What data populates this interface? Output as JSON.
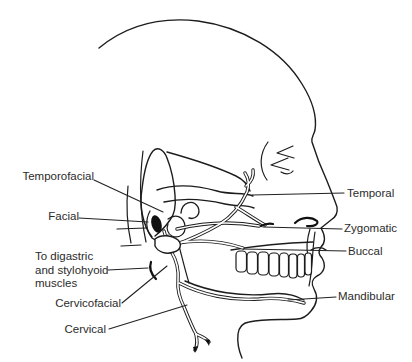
{
  "canvas": {
    "width": 412,
    "height": 362
  },
  "colors": {
    "ink": "#1c1c1c",
    "background": "#ffffff",
    "label_text": "#2b2b2b"
  },
  "figure": {
    "type": "anatomical-line-diagram"
  },
  "labels": {
    "temporofacial": "Temporofacial",
    "facial": "Facial",
    "digastric": "To digastric\nand stylohyoid\nmuscles",
    "cervicofacial": "Cervicofacial",
    "cervical": "Cervical",
    "temporal": "Temporal",
    "zygomatic": "Zygomatic",
    "buccal": "Buccal",
    "mandibular": "Mandibular"
  }
}
